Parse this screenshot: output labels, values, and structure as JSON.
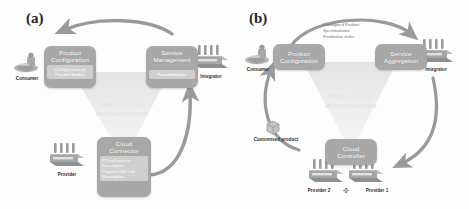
{
  "figure": {
    "background": "#ffffff",
    "node_color": "#a8a8a8",
    "node_inner_color": "#cfcfcf",
    "arrow_color": "#9a9a9a",
    "watermark_color": "#e8e8e8",
    "caption_color": "#2f2f2f"
  },
  "panel_a": {
    "tag": "(a)",
    "nodes": {
      "product_configuration": {
        "title_line1": "Product",
        "title_line2": "Configuration",
        "body": [
          "Configuration of",
          "Façade Modue"
        ]
      },
      "service_management": {
        "title_line1": "Service",
        "title_line2": "Management",
        "body": [
          "FaçadeModule"
        ]
      },
      "cloud_connector": {
        "title_line1": "Cloud",
        "title_line2": "Connector",
        "body": [
          "PV cell service",
          "Description",
          "Organic LED cell",
          "Description"
        ]
      }
    },
    "watermark": {
      "line1": "Manu Cloud",
      "line2": "Infrastructure"
    },
    "actors": {
      "consumer": "Consumer",
      "integrator": "Integrator",
      "provider": "Provider"
    }
  },
  "panel_b": {
    "tag": "(b)",
    "nodes": {
      "product_configuration": {
        "title_line1": "Product",
        "title_line2": "Configuration",
        "body": []
      },
      "service_aggregation": {
        "title_line1": "Service",
        "title_line2": "Aggregation",
        "body": []
      },
      "cloud_connector": {
        "title_line1": "Cloud",
        "title_line2": "Controller",
        "body": []
      }
    },
    "watermark": {
      "line1": "Manu Cloud",
      "line2": "Infrastructure"
    },
    "annotation": {
      "line1": "Configured Product",
      "line2": "Specifications/",
      "line3": "Production order"
    },
    "actors": {
      "consumer": "Consumer",
      "integrator": "Integrator",
      "customised_product": "Customised product",
      "provider_2": "Provider 2",
      "provider_1": "Provider 1",
      "provider_link": "-()-"
    }
  }
}
